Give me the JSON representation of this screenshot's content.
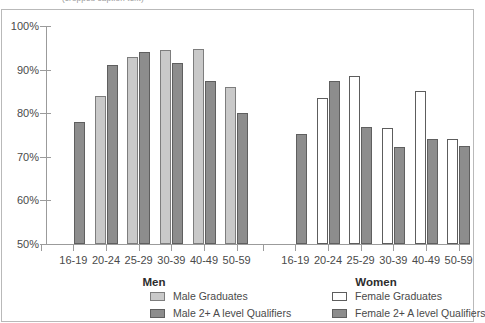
{
  "top_caption": "(cropped caption text)",
  "chart_data": {
    "type": "bar",
    "title": "",
    "xlabel": "",
    "ylabel": "",
    "ylim": [
      50,
      100
    ],
    "yticks": [
      "50%",
      "60%",
      "70%",
      "80%",
      "90%",
      "100%"
    ],
    "ytick_values": [
      50,
      60,
      70,
      80,
      90,
      100
    ],
    "grid": false,
    "legend_position": "bottom",
    "panels": [
      {
        "name": "Men",
        "label": "Men",
        "categories": [
          "16-19",
          "20-24",
          "25-29",
          "30-39",
          "40-49",
          "50-59"
        ],
        "series": [
          {
            "name": "Male Graduates",
            "color": "#c9c9c9",
            "values": [
              null,
              84.0,
              93.0,
              94.6,
              94.8,
              86.0
            ]
          },
          {
            "name": "Male 2+ A level Qualifiers",
            "color": "#8d8d8d",
            "values": [
              78.0,
              91.0,
              94.0,
              91.6,
              87.4,
              80.1
            ]
          }
        ]
      },
      {
        "name": "Women",
        "label": "Women",
        "categories": [
          "16-19",
          "20-24",
          "25-29",
          "30-39",
          "40-49",
          "50-59"
        ],
        "series": [
          {
            "name": "Female Graduates",
            "color": "#ffffff",
            "values": [
              null,
              83.4,
              88.5,
              76.5,
              85.0,
              74.0
            ]
          },
          {
            "name": "Female 2+ A level Qualifiers",
            "color": "#8d8d8d",
            "values": [
              75.3,
              87.4,
              76.8,
              72.3,
              74.0,
              72.5
            ]
          }
        ]
      }
    ],
    "legend": [
      {
        "label": "Male Graduates",
        "swatch": "grad"
      },
      {
        "label": "Male 2+ A level Qualifiers",
        "swatch": "alevel"
      },
      {
        "label": "Female Graduates",
        "swatch": "grad-f"
      },
      {
        "label": "Female 2+ A level Qualifiers",
        "swatch": "alevel"
      }
    ]
  }
}
